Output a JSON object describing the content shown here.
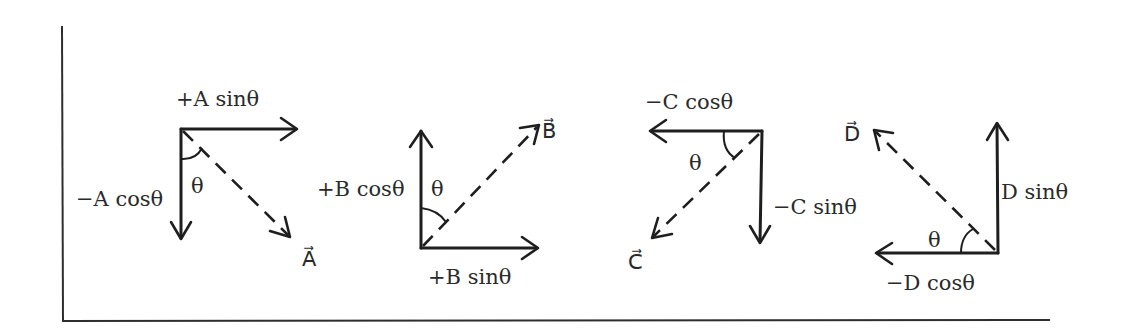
{
  "figure": {
    "diagrams": [
      {
        "vector": "A",
        "vector_label": "A⃗",
        "horizontal_label": "+A sinθ",
        "vertical_label": "−A cosθ",
        "angle_label": "θ",
        "horizontal_direction": "right",
        "vertical_direction": "down"
      },
      {
        "vector": "B",
        "vector_label": "B⃗",
        "horizontal_label": "+B sinθ",
        "vertical_label": "+B cosθ",
        "angle_label": "θ",
        "horizontal_direction": "right",
        "vertical_direction": "up"
      },
      {
        "vector": "C",
        "vector_label": "C⃗",
        "horizontal_label": "−C cosθ",
        "vertical_label": "−C sinθ",
        "angle_label": "θ",
        "horizontal_direction": "left",
        "vertical_direction": "down"
      },
      {
        "vector": "D",
        "vector_label": "D⃗",
        "horizontal_label": "−D cosθ",
        "vertical_label": "D sinθ",
        "angle_label": "θ",
        "horizontal_direction": "left",
        "vertical_direction": "up"
      }
    ]
  }
}
